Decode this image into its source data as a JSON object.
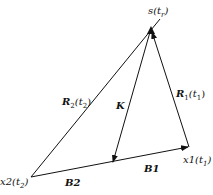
{
  "diagram": {
    "points": {
      "source": {
        "x": 151,
        "y": 30,
        "label": "s(t_r)"
      },
      "x1": {
        "x": 189,
        "y": 147,
        "label": "x1(t_1)"
      },
      "x2": {
        "x": 31,
        "y": 177,
        "label": "x2(t_2)"
      },
      "k_end": {
        "x": 113,
        "y": 163
      }
    },
    "labels": {
      "source": {
        "base": "s(t",
        "sub": "r",
        "close": ")"
      },
      "r1": {
        "base": "R",
        "sub1": "1",
        "mid": "(t",
        "sub2": "1",
        "close": ")"
      },
      "r2": {
        "base": "R",
        "sub1": "2",
        "mid": "(t",
        "sub2": "2",
        "close": ")"
      },
      "k": "K",
      "b1": "B1",
      "b2": "B2",
      "x1": {
        "base": "x1(t",
        "sub": "1",
        "close": ")"
      },
      "x2": {
        "base": "x2(t",
        "sub": "2",
        "close": ")"
      }
    },
    "color": "#111111"
  }
}
